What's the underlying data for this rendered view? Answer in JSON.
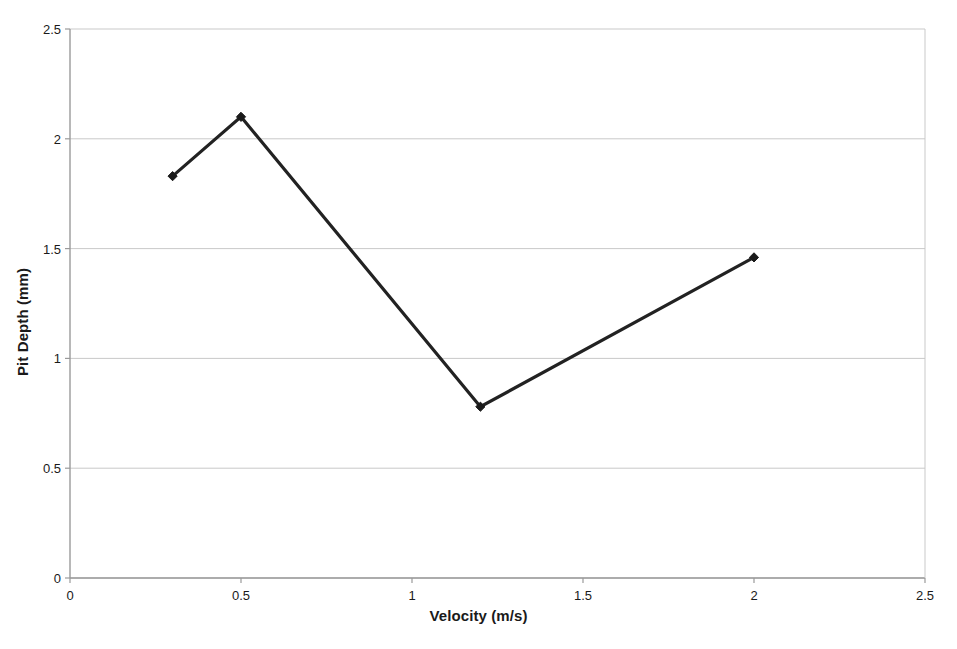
{
  "chart_data": {
    "type": "line",
    "title": "",
    "subtitle": "",
    "xlabel": "Velocity (m/s)",
    "ylabel": "Pit Depth (mm)",
    "xlim": [
      0,
      2.5
    ],
    "ylim": [
      0,
      2.5
    ],
    "xticks": [
      "0",
      "0.5",
      "1",
      "1.5",
      "2",
      "2.5"
    ],
    "xtick_values": [
      0,
      0.5,
      1,
      1.5,
      2,
      2.5
    ],
    "yticks": [
      "0",
      "0.5",
      "1",
      "1.5",
      "2",
      "2.5"
    ],
    "ytick_values": [
      0,
      0.5,
      1,
      1.5,
      2,
      2.5
    ],
    "grid": "horizontal",
    "legend": "none",
    "series": [
      {
        "name": "Pit Depth",
        "marker": "diamond",
        "color": "#222222",
        "x": [
          0.3,
          0.5,
          1.2,
          2.0
        ],
        "y": [
          1.83,
          2.1,
          0.78,
          1.46
        ]
      }
    ],
    "points": [
      {
        "x": 0.3,
        "y": 1.83
      },
      {
        "x": 0.5,
        "y": 2.1
      },
      {
        "x": 1.2,
        "y": 0.78
      },
      {
        "x": 2.0,
        "y": 1.46
      }
    ],
    "colors": {
      "line": "#222222",
      "marker": "#1a1a1a",
      "gridline": "#c9c9c9",
      "axis": "#9a9a9a",
      "background": "#ffffff",
      "text": "#1a1a1a"
    }
  }
}
